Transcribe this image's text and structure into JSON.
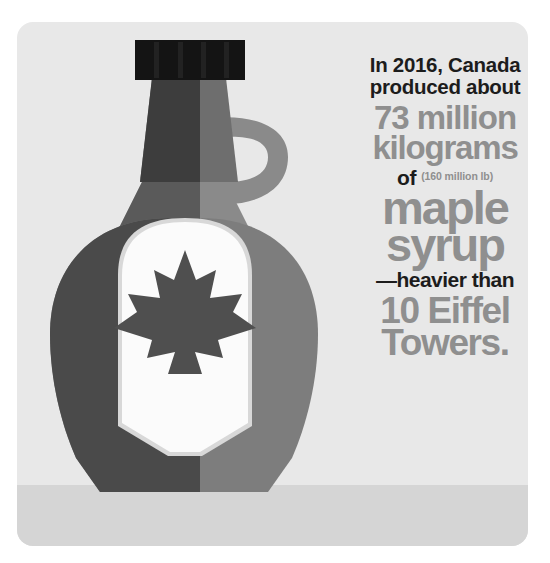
{
  "card": {
    "background_color": "#e8e8e8",
    "ground_band_color": "#d5d5d5"
  },
  "illustration": {
    "name": "maple-syrup-bottle",
    "cap_color": "#141414",
    "neck_dark_color": "#3d3d3d",
    "neck_light_color": "#6e6e6e",
    "body_dark_color": "#4a4a4a",
    "body_light_color": "#7d7d7d",
    "shoulder_dark_color": "#5a5a5a",
    "shoulder_light_color": "#8a8a8a",
    "handle_color": "#8a8a8a",
    "label_color": "#fbfbfb",
    "label_shadow_color": "#d8d8d8",
    "leaf_color": "#4f4f4f",
    "cap_ridge_count": 4
  },
  "headline": {
    "intro_line1": "In 2016, Canada",
    "intro_line2": "produced about",
    "amount": "73 million",
    "unit": "kilograms",
    "of_word": "of",
    "conversion": "(160 million lb)",
    "product_line1": "maple",
    "product_line2": "syrup",
    "comparison_intro": "—heavier than",
    "comparison_line1": "10 Eiffel",
    "comparison_line2": "Towers.",
    "dark_text_color": "#1c1c1c",
    "gray_text_color": "#8f8f8f"
  }
}
